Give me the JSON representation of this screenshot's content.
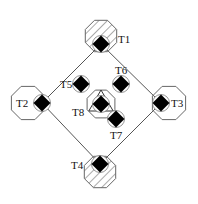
{
  "diagram": {
    "title": "",
    "colors": {
      "line": "#555555",
      "node_fill": "#000000",
      "outline": "#666666",
      "background": "#ffffff"
    },
    "nodes": [
      {
        "id": "T1",
        "label": "T1",
        "shape": "hatched-circle",
        "cx": 101,
        "cy": 36,
        "r": 17,
        "sq": [
          101,
          44
        ],
        "lx": 118,
        "ly": 43
      },
      {
        "id": "T2",
        "label": "T2",
        "shape": "octagon",
        "cx": 28,
        "cy": 103,
        "r": 18,
        "sq": [
          42,
          103
        ],
        "lx": 16,
        "ly": 107
      },
      {
        "id": "T3",
        "label": "T3",
        "shape": "octagon",
        "cx": 169,
        "cy": 103,
        "r": 18,
        "sq": [
          161,
          103
        ],
        "lx": 171,
        "ly": 107
      },
      {
        "id": "T4",
        "label": "T4",
        "shape": "hatched-circle",
        "cx": 100,
        "cy": 172,
        "r": 17,
        "sq": [
          100,
          164
        ],
        "lx": 71,
        "ly": 169
      },
      {
        "id": "T5",
        "label": "T5",
        "shape": "square",
        "sq": [
          81,
          84
        ],
        "lx": 60,
        "ly": 88
      },
      {
        "id": "T6",
        "label": "T6",
        "shape": "square",
        "sq": [
          121,
          84
        ],
        "lx": 115,
        "ly": 74
      },
      {
        "id": "T7",
        "label": "T7",
        "shape": "square",
        "sq": [
          116,
          119
        ],
        "lx": 110,
        "ly": 139
      },
      {
        "id": "T8",
        "label": "T8",
        "shape": "triangle-in-octagon",
        "cx": 101,
        "cy": 104,
        "r": 15,
        "sq": [
          101,
          104
        ],
        "lx": 72,
        "ly": 116
      }
    ],
    "edges": [
      {
        "from": "T1",
        "to": "T2"
      },
      {
        "from": "T1",
        "to": "T3"
      },
      {
        "from": "T2",
        "to": "T4"
      },
      {
        "from": "T3",
        "to": "T4"
      }
    ]
  }
}
